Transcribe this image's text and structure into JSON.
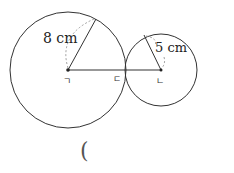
{
  "diagram": {
    "big_circle": {
      "radius_label": "8 cm",
      "center_label": "ㄱ"
    },
    "small_circle": {
      "radius_label": "5 cm",
      "center_label": "ㄴ"
    },
    "tangent_point_label": "ㄷ",
    "answer_paren": "("
  }
}
